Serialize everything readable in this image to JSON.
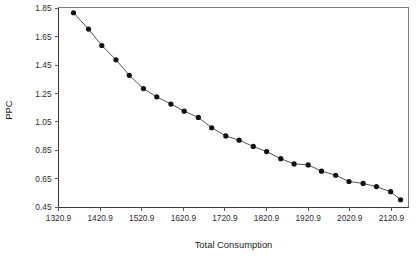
{
  "chart_data": {
    "type": "line",
    "title": "",
    "subtitle": "",
    "xlabel": "Total Consumption",
    "ylabel": "PPC",
    "xlim": [
      1320.9,
      2162.0
    ],
    "ylim": [
      0.45,
      1.857
    ],
    "grid": false,
    "legend": null,
    "legend_position": "none",
    "markers": "filled-circle",
    "line_style": "solid",
    "xticks": [
      1320.9,
      1420.9,
      1520.9,
      1620.9,
      1720.9,
      1820.9,
      1920.9,
      2020.9,
      2120.9
    ],
    "xtick_labels": [
      "1320.9",
      "1420.9",
      "1520.9",
      "1620.9",
      "1720.9",
      "1820.9",
      "1920.9",
      "2020.9",
      "2120.9"
    ],
    "yticks": [
      1.85,
      1.65,
      1.45,
      1.25,
      1.05,
      0.85,
      0.65,
      0.45
    ],
    "ytick_labels": [
      "1.85",
      "1.65",
      "1.45",
      "1.25",
      "1.05",
      "0.85",
      "0.65",
      "0.45"
    ],
    "x": [
      1357,
      1393,
      1425,
      1459,
      1491,
      1525,
      1557,
      1591,
      1623,
      1657,
      1689,
      1723,
      1755,
      1789,
      1821,
      1855,
      1887,
      1921,
      1953,
      1987,
      2019,
      2053,
      2085,
      2119,
      2143
    ],
    "values": [
      1.82,
      1.705,
      1.589,
      1.488,
      1.379,
      1.285,
      1.227,
      1.176,
      1.126,
      1.082,
      1.009,
      0.951,
      0.921,
      0.877,
      0.841,
      0.791,
      0.754,
      0.747,
      0.703,
      0.674,
      0.63,
      0.616,
      0.594,
      0.558,
      0.501
    ],
    "series": [
      {
        "name": "PPC",
        "color": "#111111",
        "x": [
          1357,
          1393,
          1425,
          1459,
          1491,
          1525,
          1557,
          1591,
          1623,
          1657,
          1689,
          1723,
          1755,
          1789,
          1821,
          1855,
          1887,
          1921,
          1953,
          1987,
          2019,
          2053,
          2085,
          2119,
          2143
        ],
        "values": [
          1.82,
          1.705,
          1.589,
          1.488,
          1.379,
          1.285,
          1.227,
          1.176,
          1.126,
          1.082,
          1.009,
          0.951,
          0.921,
          0.877,
          0.841,
          0.791,
          0.754,
          0.747,
          0.703,
          0.674,
          0.63,
          0.616,
          0.594,
          0.558,
          0.501
        ]
      }
    ],
    "annotations": [],
    "point_count": 25
  },
  "style": {
    "axis_color": "#7d7d7d",
    "tick_color": "#5a5a5a",
    "line_color": "#555555",
    "marker_color": "#111111",
    "text_color": "#1a1a1a",
    "background": "#ffffff"
  }
}
